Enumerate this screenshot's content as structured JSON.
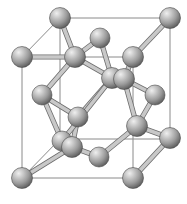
{
  "figure": {
    "kind": "crystal-lattice-diagram",
    "background_color": "#ffffff",
    "width": 187,
    "height": 204
  },
  "style": {
    "cube_edge_color": "#8a8a8a",
    "cube_hidden_edge_color": "#9a9a9a",
    "bond_outline_color": "#6e6e6e",
    "bond_core_color": "#c8c8c8",
    "atom_highlight_color": "#e8e8e8",
    "atom_mid_color": "#9b9b9b",
    "atom_shadow_color": "#4f4f4f",
    "atom_edge_color": "#4a4a4a"
  },
  "cube": {
    "vertices": {
      "back_top_left": {
        "x": 60,
        "y": 18
      },
      "back_top_right": {
        "x": 170,
        "y": 18
      },
      "front_top_left": {
        "x": 22,
        "y": 57
      },
      "front_top_right": {
        "x": 133,
        "y": 57
      },
      "back_bottom_left": {
        "x": 60,
        "y": 139
      },
      "back_bottom_right": {
        "x": 170,
        "y": 139
      },
      "front_bottom_left": {
        "x": 22,
        "y": 178
      },
      "front_bottom_right": {
        "x": 133,
        "y": 178
      }
    },
    "edges": [
      {
        "from": "back_top_left",
        "to": "back_top_right",
        "hidden": false
      },
      {
        "from": "back_top_left",
        "to": "front_top_left",
        "hidden": false
      },
      {
        "from": "back_top_right",
        "to": "front_top_right",
        "hidden": false
      },
      {
        "from": "front_top_left",
        "to": "front_top_right",
        "hidden": false
      },
      {
        "from": "front_top_left",
        "to": "front_bottom_left",
        "hidden": false
      },
      {
        "from": "front_top_right",
        "to": "front_bottom_right",
        "hidden": false
      },
      {
        "from": "back_top_left",
        "to": "back_bottom_left",
        "hidden": false
      },
      {
        "from": "back_top_right",
        "to": "back_bottom_right",
        "hidden": false
      },
      {
        "from": "front_bottom_left",
        "to": "front_bottom_right",
        "hidden": false
      },
      {
        "from": "back_bottom_left",
        "to": "back_bottom_right",
        "hidden": false
      },
      {
        "from": "front_bottom_left",
        "to": "back_bottom_left",
        "hidden": false
      },
      {
        "from": "front_bottom_right",
        "to": "back_bottom_right",
        "hidden": false
      }
    ]
  },
  "atoms": [
    {
      "id": "a1",
      "label": "corner-back-top-left",
      "x": 60,
      "y": 18,
      "r": 10.5,
      "site": "corner"
    },
    {
      "id": "a2",
      "label": "corner-back-top-right",
      "x": 170,
      "y": 18,
      "r": 10.5,
      "site": "corner"
    },
    {
      "id": "a3",
      "label": "corner-front-top-left",
      "x": 22,
      "y": 57,
      "r": 10.5,
      "site": "corner"
    },
    {
      "id": "a4",
      "label": "corner-front-top-right",
      "x": 133,
      "y": 57,
      "r": 10.5,
      "site": "corner"
    },
    {
      "id": "a5",
      "label": "corner-front-bottom-left",
      "x": 22,
      "y": 178,
      "r": 10.5,
      "site": "corner"
    },
    {
      "id": "a6",
      "label": "corner-front-bottom-right",
      "x": 133,
      "y": 178,
      "r": 10.5,
      "site": "corner"
    },
    {
      "id": "a7",
      "label": "corner-back-bottom-right",
      "x": 170,
      "y": 138,
      "r": 10.5,
      "site": "corner"
    },
    {
      "id": "a8",
      "label": "face-center-top",
      "x": 100,
      "y": 38,
      "r": 10.0,
      "site": "face-center"
    },
    {
      "id": "a9",
      "label": "face-center-upper-left",
      "x": 75,
      "y": 57,
      "r": 10.5,
      "site": "face-center"
    },
    {
      "id": "a10",
      "label": "face-center-left",
      "x": 42,
      "y": 95,
      "r": 10.0,
      "site": "face-center"
    },
    {
      "id": "a11",
      "label": "face-center-right",
      "x": 155,
      "y": 95,
      "r": 10.0,
      "site": "face-center"
    },
    {
      "id": "a12",
      "label": "interior-center-left",
      "x": 112,
      "y": 78,
      "r": 10.5,
      "site": "tetrahedral-interior"
    },
    {
      "id": "a13",
      "label": "interior-center-right",
      "x": 124,
      "y": 79,
      "r": 10.5,
      "site": "tetrahedral-interior"
    },
    {
      "id": "a14",
      "label": "interior-mid-left",
      "x": 78,
      "y": 117,
      "r": 10.0,
      "site": "tetrahedral-interior"
    },
    {
      "id": "a15",
      "label": "interior-mid-right",
      "x": 137,
      "y": 126,
      "r": 10.5,
      "site": "tetrahedral-interior"
    },
    {
      "id": "a16",
      "label": "interior-lower-left-back",
      "x": 62,
      "y": 141,
      "r": 10.0,
      "site": "tetrahedral-interior"
    },
    {
      "id": "a17",
      "label": "interior-lower-left-front",
      "x": 72,
      "y": 147,
      "r": 10.5,
      "site": "tetrahedral-interior"
    },
    {
      "id": "a18",
      "label": "face-center-bottom",
      "x": 99,
      "y": 157,
      "r": 10.0,
      "site": "face-center"
    }
  ],
  "bonds": [
    {
      "from": "a1",
      "to": "a9"
    },
    {
      "from": "a3",
      "to": "a9"
    },
    {
      "from": "a8",
      "to": "a9"
    },
    {
      "from": "a8",
      "to": "a12"
    },
    {
      "from": "a9",
      "to": "a12"
    },
    {
      "from": "a9",
      "to": "a10"
    },
    {
      "from": "a4",
      "to": "a13"
    },
    {
      "from": "a2",
      "to": "a4"
    },
    {
      "from": "a12",
      "to": "a14"
    },
    {
      "from": "a13",
      "to": "a11"
    },
    {
      "from": "a13",
      "to": "a15"
    },
    {
      "from": "a12",
      "to": "a13"
    },
    {
      "from": "a10",
      "to": "a14"
    },
    {
      "from": "a14",
      "to": "a17"
    },
    {
      "from": "a16",
      "to": "a17"
    },
    {
      "from": "a17",
      "to": "a18"
    },
    {
      "from": "a17",
      "to": "a5"
    },
    {
      "from": "a15",
      "to": "a18"
    },
    {
      "from": "a15",
      "to": "a7"
    },
    {
      "from": "a15",
      "to": "a11"
    },
    {
      "from": "a7",
      "to": "a6"
    },
    {
      "from": "a16",
      "to": "a12"
    },
    {
      "from": "a16",
      "to": "a10"
    }
  ]
}
